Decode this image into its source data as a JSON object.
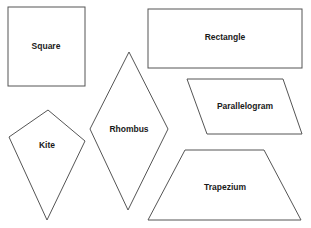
{
  "diagram": {
    "title": "",
    "shapes": [
      {
        "id": "square",
        "label": "Square",
        "type": "rect",
        "x": 8,
        "y": 7,
        "w": 77,
        "h": 79,
        "label_x": 46,
        "label_y": 47
      },
      {
        "id": "rectangle",
        "label": "Rectangle",
        "type": "rect",
        "x": 148,
        "y": 9,
        "w": 154,
        "h": 59,
        "label_x": 225,
        "label_y": 38
      },
      {
        "id": "rhombus",
        "label": "Rhombus",
        "type": "polygon",
        "points": "129,52 168,129 128,210 90,129",
        "label_x": 129,
        "label_y": 130
      },
      {
        "id": "kite",
        "label": "Kite",
        "type": "polygon",
        "points": "48,110 85,141 47,220 9,137",
        "label_x": 47,
        "label_y": 146
      },
      {
        "id": "parallelogram",
        "label": "Parallelogram",
        "type": "polygon",
        "points": "187,79 283,79 302,134 207,134",
        "label_x": 245,
        "label_y": 107
      },
      {
        "id": "trapezium",
        "label": "Trapezium",
        "type": "polygon",
        "points": "185,150 264,150 301,220 148,220",
        "label_x": 225,
        "label_y": 188
      }
    ],
    "stroke_color": "#555555",
    "fill_color": "#ffffff",
    "text_color": "#1a1a1a"
  }
}
